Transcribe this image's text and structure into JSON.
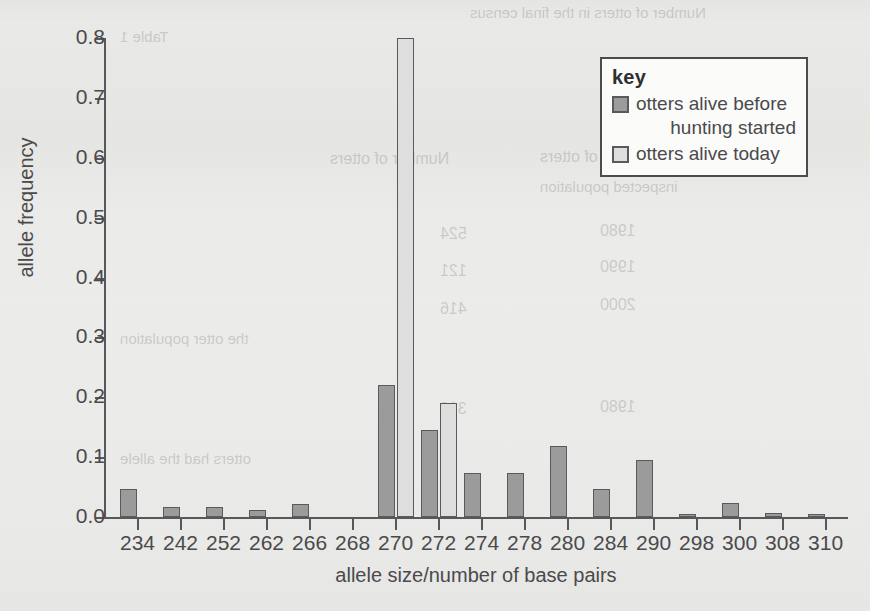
{
  "chart_data": {
    "type": "bar",
    "title": "",
    "xlabel": "allele size/number of base pairs",
    "ylabel": "allele frequency",
    "ylim": [
      0.0,
      0.8
    ],
    "yticks": [
      "0.0",
      "0.1",
      "0.2",
      "0.3",
      "0.4",
      "0.5",
      "0.6",
      "0.7",
      "0.8"
    ],
    "grid": false,
    "legend_position": "top-right",
    "legend_title": "key",
    "categories": [
      "234",
      "242",
      "252",
      "262",
      "266",
      "268",
      "270",
      "272",
      "274",
      "278",
      "280",
      "284",
      "290",
      "298",
      "300",
      "308",
      "310"
    ],
    "series": [
      {
        "name": "otters alive before hunting started",
        "color": "#9b9b9b",
        "values": [
          0.047,
          0.016,
          0.016,
          0.012,
          0.021,
          0.0,
          0.22,
          0.146,
          0.073,
          0.073,
          0.118,
          0.046,
          0.095,
          0.005,
          0.023,
          0.007,
          0.005
        ]
      },
      {
        "name": "otters alive today",
        "color": "#dedede",
        "values": [
          0.0,
          0.0,
          0.0,
          0.0,
          0.0,
          0.0,
          0.8,
          0.19,
          0.0,
          0.0,
          0.0,
          0.0,
          0.0,
          0.0,
          0.0,
          0.0,
          0.0
        ]
      }
    ]
  },
  "legend": {
    "title": "key",
    "items": [
      {
        "label_line1": "otters alive before",
        "label_line2": "hunting started",
        "swatch": "s0"
      },
      {
        "label_line1": "otters alive today",
        "label_line2": "",
        "swatch": "s1"
      }
    ]
  },
  "colors": {
    "series_before": "#9b9b9b",
    "series_today": "#dedede",
    "axis": "#58585a",
    "text": "#4a4a4c",
    "background": "#e9e9e7"
  },
  "ghost_text": [
    {
      "text": "Number of otters in the final census",
      "x": 470,
      "y": 4,
      "size": 15
    },
    {
      "text": "Table 1",
      "x": 120,
      "y": 28,
      "size": 15
    },
    {
      "text": "Number of otters",
      "x": 540,
      "y": 148,
      "size": 16
    },
    {
      "text": "Number of otters",
      "x": 330,
      "y": 150,
      "size": 16
    },
    {
      "text": "inspected  population",
      "x": 540,
      "y": 178,
      "size": 15
    },
    {
      "text": "1980",
      "x": 600,
      "y": 222,
      "size": 16
    },
    {
      "text": "524",
      "x": 440,
      "y": 225,
      "size": 16
    },
    {
      "text": "1990",
      "x": 600,
      "y": 258,
      "size": 16
    },
    {
      "text": "121",
      "x": 440,
      "y": 262,
      "size": 16
    },
    {
      "text": "2000",
      "x": 600,
      "y": 296,
      "size": 16
    },
    {
      "text": "416",
      "x": 440,
      "y": 300,
      "size": 16
    },
    {
      "text": "1980",
      "x": 600,
      "y": 398,
      "size": 16
    },
    {
      "text": "312",
      "x": 440,
      "y": 400,
      "size": 16
    },
    {
      "text": "the otter population",
      "x": 120,
      "y": 330,
      "size": 15
    },
    {
      "text": "otters had the allele",
      "x": 120,
      "y": 450,
      "size": 15
    }
  ]
}
